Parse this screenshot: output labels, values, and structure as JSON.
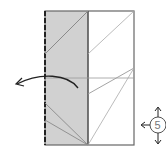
{
  "diagram": {
    "type": "origami-fold-diagram",
    "step": {
      "number": "5",
      "icon": "rotate-flip-arrows-icon"
    },
    "colors": {
      "shaded_panel": "#d1d1d1",
      "outline": "#555555",
      "crease": "#9a9a9a",
      "arrow": "#222222"
    },
    "annotations": {
      "fold_arrow": "valley-fold-left-arrow",
      "edge_marker": "dashed-mountain-edge"
    }
  }
}
